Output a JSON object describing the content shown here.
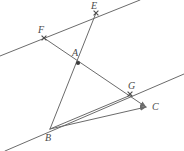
{
  "figure": {
    "width": 184,
    "height": 151,
    "background_color": "#ffffff",
    "line_color": "#6b6b6b",
    "label_color": "#4a4a4a",
    "label_font_size": 10,
    "points": [
      {
        "id": "F",
        "label": "F",
        "x": 44,
        "y": 38,
        "label_x": 38,
        "label_y": 25,
        "marker": "tick"
      },
      {
        "id": "E",
        "label": "E",
        "x": 96,
        "y": 13,
        "label_x": 91,
        "label_y": 1,
        "marker": "tick"
      },
      {
        "id": "A",
        "label": "A",
        "x": 78,
        "y": 63,
        "label_x": 72,
        "label_y": 48,
        "marker": "dot"
      },
      {
        "id": "G",
        "label": "G",
        "x": 130,
        "y": 94,
        "label_x": 128,
        "label_y": 81,
        "marker": "tick"
      },
      {
        "id": "C",
        "label": "C",
        "x": 146,
        "y": 107,
        "label_x": 152,
        "label_y": 102,
        "marker": "arrow"
      },
      {
        "id": "B",
        "label": "B",
        "x": 50,
        "y": 129,
        "label_x": 45,
        "label_y": 133,
        "marker": "arrow"
      }
    ],
    "segments": [
      {
        "id": "line-upper-parallel",
        "name": "upper-parallel-line",
        "x1": 0,
        "y1": 56,
        "x2": 140,
        "y2": 0,
        "arrow_end": false
      },
      {
        "id": "line-lower-parallel",
        "name": "lower-parallel-line",
        "x1": 5,
        "y1": 151,
        "x2": 184,
        "y2": 74,
        "arrow_end": false
      },
      {
        "id": "line-b-e",
        "name": "transversal-B-A-E",
        "x1": 50,
        "y1": 129,
        "x2": 96,
        "y2": 13,
        "arrow_end": false
      },
      {
        "id": "line-f-c",
        "name": "transversal-F-A-G-C",
        "x1": 44,
        "y1": 38,
        "x2": 146,
        "y2": 107,
        "arrow_end": true
      },
      {
        "id": "line-b-c",
        "name": "segment-B-C",
        "x1": 50,
        "y1": 129,
        "x2": 146,
        "y2": 107,
        "arrow_end": true
      },
      {
        "id": "line-b-g",
        "name": "segment-B-G",
        "x1": 50,
        "y1": 129,
        "x2": 131,
        "y2": 95,
        "arrow_end": false
      }
    ]
  }
}
